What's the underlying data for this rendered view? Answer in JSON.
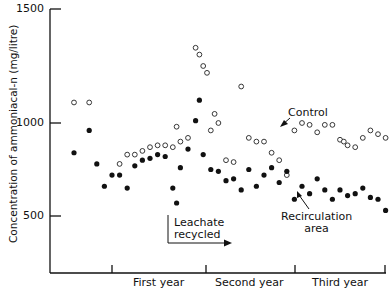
{
  "chart_data": {
    "type": "scatter",
    "title": "",
    "xlabel": "",
    "ylabel": "Concentration of ammoniacal-n (mg/litre)",
    "y_ticks": [
      "1500",
      "1000",
      "500"
    ],
    "y_tick_values": [
      1500,
      1000,
      500
    ],
    "ylim": [
      300,
      1500
    ],
    "x_categories": [
      "First year",
      "Second year",
      "Third year"
    ],
    "xlim_months": [
      -8,
      36
    ],
    "grid": false,
    "legend": "annotations",
    "annotations": {
      "control": "Control",
      "recirculation_line1": "Recirculation",
      "recirculation_line2": "area",
      "leachate_line1": "Leachate",
      "leachate_line2": "recycled"
    },
    "series": [
      {
        "name": "Control",
        "marker": "open-circle",
        "points": [
          [
            -5,
            1090
          ],
          [
            -3,
            1090
          ],
          [
            1,
            780
          ],
          [
            2,
            830
          ],
          [
            3,
            830
          ],
          [
            4,
            850
          ],
          [
            5,
            870
          ],
          [
            6,
            880
          ],
          [
            7,
            880
          ],
          [
            8,
            870
          ],
          [
            8.5,
            980
          ],
          [
            9,
            900
          ],
          [
            10,
            920
          ],
          [
            11,
            1330
          ],
          [
            11.5,
            1300
          ],
          [
            12,
            1250
          ],
          [
            12.5,
            1220
          ],
          [
            13,
            960
          ],
          [
            13.5,
            1040
          ],
          [
            14,
            1000
          ],
          [
            15,
            800
          ],
          [
            16,
            790
          ],
          [
            17,
            1160
          ],
          [
            18,
            920
          ],
          [
            19,
            900
          ],
          [
            20,
            900
          ],
          [
            21,
            840
          ],
          [
            22,
            800
          ],
          [
            23,
            720
          ],
          [
            24,
            960
          ],
          [
            25,
            1000
          ],
          [
            26,
            990
          ],
          [
            27,
            950
          ],
          [
            28,
            990
          ],
          [
            29,
            990
          ],
          [
            30,
            910
          ],
          [
            30.5,
            900
          ],
          [
            31,
            880
          ],
          [
            32,
            870
          ],
          [
            33,
            920
          ],
          [
            34,
            960
          ],
          [
            35,
            940
          ],
          [
            36,
            920
          ]
        ],
        "y_values_note": "approximate readings from pixel positions"
      },
      {
        "name": "Recirculation area",
        "marker": "filled-circle",
        "points": [
          [
            -5,
            840
          ],
          [
            -3,
            960
          ],
          [
            -2,
            780
          ],
          [
            -1,
            660
          ],
          [
            0,
            720
          ],
          [
            1,
            720
          ],
          [
            2,
            650
          ],
          [
            3,
            770
          ],
          [
            4,
            800
          ],
          [
            5,
            810
          ],
          [
            6,
            830
          ],
          [
            7,
            820
          ],
          [
            8,
            650
          ],
          [
            8.5,
            570
          ],
          [
            9,
            760
          ],
          [
            10,
            860
          ],
          [
            11,
            1010
          ],
          [
            11.5,
            1100
          ],
          [
            12,
            830
          ],
          [
            13,
            750
          ],
          [
            14,
            740
          ],
          [
            15,
            690
          ],
          [
            16,
            700
          ],
          [
            17,
            640
          ],
          [
            18,
            750
          ],
          [
            19,
            660
          ],
          [
            20,
            720
          ],
          [
            21,
            760
          ],
          [
            22,
            680
          ],
          [
            23,
            740
          ],
          [
            24,
            590
          ],
          [
            25,
            660
          ],
          [
            26,
            620
          ],
          [
            27,
            700
          ],
          [
            28,
            640
          ],
          [
            29,
            590
          ],
          [
            30,
            640
          ],
          [
            31,
            610
          ],
          [
            32,
            620
          ],
          [
            33,
            650
          ],
          [
            34,
            600
          ],
          [
            35,
            590
          ],
          [
            36,
            530
          ]
        ]
      }
    ]
  }
}
